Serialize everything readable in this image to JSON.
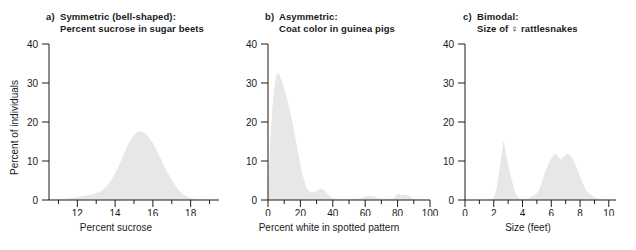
{
  "figure": {
    "panels": [
      {
        "letter": "a)",
        "title_line1": "Symmetric (bell-shaped):",
        "title_line2": "Percent sucrose in sugar beets",
        "xlabel": "Percent sucrose",
        "ylabel": "Percent of individuals"
      },
      {
        "letter": "b)",
        "title_line1": "Asymmetric:",
        "title_line2": "Coat color in guinea pigs",
        "xlabel": "Percent white in spotted pattern",
        "ylabel": "Percent of individuals"
      },
      {
        "letter": "c)",
        "title_line1": "Bimodal:",
        "title_line2": "Size of ♀ rattlesnakes",
        "xlabel": "Size (feet)",
        "ylabel": "Percent of individuals"
      }
    ],
    "colors": {
      "curve_fill": "#e7e7e7",
      "axis": "#1a1a1a",
      "text": "#1a1a1a",
      "background": "#ffffff"
    }
  },
  "chart_data": [
    {
      "type": "area",
      "title": "Symmetric (bell-shaped): Percent sucrose in sugar beets",
      "xlabel": "Percent sucrose",
      "ylabel": "Percent of individuals",
      "xlim": [
        10.5,
        19.5
      ],
      "ylim": [
        0,
        40
      ],
      "ytick_labels": [
        "0",
        "10",
        "20",
        "30",
        "40"
      ],
      "yticks": [
        0,
        10,
        20,
        30,
        40
      ],
      "xtick_labels": [
        "12",
        "14",
        "16",
        "18"
      ],
      "xticks_major": [
        12,
        14,
        16,
        18
      ],
      "xticks_minor": [
        11,
        13,
        15,
        17,
        19
      ],
      "grid": false,
      "legend": "none",
      "x": [
        10.5,
        11.0,
        11.5,
        12.0,
        12.3,
        12.6,
        12.9,
        13.2,
        13.5,
        13.8,
        14.1,
        14.4,
        14.7,
        15.0,
        15.3,
        15.6,
        15.9,
        16.2,
        16.5,
        16.8,
        17.1,
        17.4,
        17.7,
        18.0,
        18.5,
        19.0,
        19.5
      ],
      "values": [
        0.0,
        0.2,
        0.4,
        0.7,
        1.0,
        1.3,
        1.6,
        2.2,
        3.3,
        5.2,
        7.8,
        11.0,
        14.3,
        16.6,
        17.6,
        17.0,
        15.3,
        12.7,
        9.7,
        6.8,
        4.3,
        2.4,
        1.2,
        0.5,
        0.1,
        0.0,
        0.0
      ]
    },
    {
      "type": "area",
      "title": "Asymmetric: Coat color in guinea pigs",
      "xlabel": "Percent white in spotted pattern",
      "ylabel": "Percent of individuals",
      "xlim": [
        0,
        100
      ],
      "ylim": [
        0,
        40
      ],
      "ytick_labels": [
        "0",
        "10",
        "20",
        "30",
        "40"
      ],
      "yticks": [
        0,
        10,
        20,
        30,
        40
      ],
      "xtick_labels": [
        "0",
        "20",
        "40",
        "60",
        "80",
        "100"
      ],
      "xticks_major": [
        0,
        20,
        40,
        60,
        80,
        100
      ],
      "xticks_minor": [
        10,
        30,
        50,
        70,
        90
      ],
      "grid": false,
      "legend": "none",
      "x": [
        0,
        2,
        4,
        6,
        8,
        10,
        12,
        14,
        16,
        18,
        20,
        22,
        24,
        26,
        28,
        30,
        32,
        34,
        36,
        38,
        40,
        45,
        50,
        55,
        58,
        60,
        62,
        65,
        68,
        70,
        75,
        78,
        80,
        82,
        84,
        86,
        88,
        90,
        95,
        100
      ],
      "values": [
        2.0,
        19.0,
        29.0,
        32.5,
        31.0,
        28.5,
        25.5,
        22.0,
        18.0,
        13.5,
        9.0,
        5.5,
        3.0,
        2.1,
        2.0,
        2.3,
        2.8,
        2.7,
        2.0,
        1.0,
        0.4,
        0.2,
        0.2,
        0.3,
        0.6,
        0.9,
        1.0,
        0.9,
        0.5,
        0.3,
        0.3,
        0.6,
        1.5,
        1.2,
        1.4,
        1.2,
        0.8,
        0.3,
        0.0,
        0.0
      ]
    },
    {
      "type": "area",
      "title": "Bimodal: Size of ♀ rattlesnakes",
      "xlabel": "Size (feet)",
      "ylabel": "Percent of individuals",
      "xlim": [
        0,
        10.5
      ],
      "ylim": [
        0,
        40
      ],
      "ytick_labels": [
        "0",
        "10",
        "20",
        "30",
        "40"
      ],
      "yticks": [
        0,
        10,
        20,
        30,
        40
      ],
      "xtick_labels": [
        "0",
        "2",
        "4",
        "6",
        "8",
        "10"
      ],
      "xticks_major": [
        0,
        2,
        4,
        6,
        8,
        10
      ],
      "xticks_minor": [
        1,
        3,
        5,
        7,
        9
      ],
      "grid": false,
      "legend": "none",
      "x": [
        0,
        1.0,
        1.8,
        2.0,
        2.2,
        2.4,
        2.6,
        2.7,
        2.9,
        3.1,
        3.3,
        3.5,
        3.7,
        4.0,
        4.3,
        4.6,
        5.0,
        5.3,
        5.6,
        5.9,
        6.1,
        6.3,
        6.5,
        6.7,
        6.9,
        7.1,
        7.3,
        7.5,
        7.7,
        7.9,
        8.1,
        8.3,
        8.5,
        8.8,
        9.1,
        9.5,
        10.0,
        10.5
      ],
      "values": [
        0.0,
        0.0,
        0.2,
        0.8,
        3.0,
        8.0,
        13.0,
        15.0,
        11.0,
        7.5,
        4.5,
        2.0,
        0.7,
        0.3,
        0.4,
        0.8,
        1.8,
        4.0,
        7.5,
        10.0,
        11.2,
        11.8,
        11.0,
        10.4,
        11.2,
        11.8,
        11.4,
        10.5,
        9.0,
        7.0,
        5.0,
        3.4,
        2.2,
        1.2,
        0.6,
        0.2,
        0.0,
        0.0
      ]
    }
  ]
}
